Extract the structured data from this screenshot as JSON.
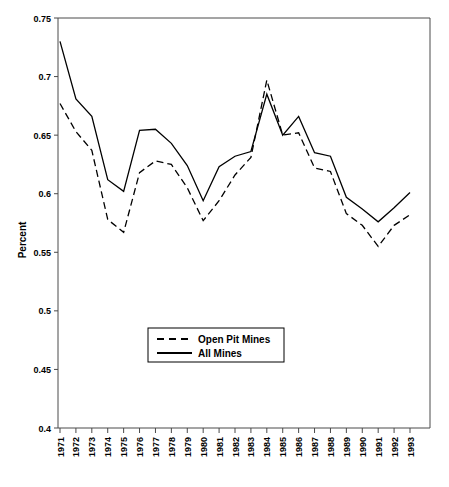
{
  "chart_data": {
    "type": "line",
    "title": "",
    "xlabel": "",
    "ylabel": "Percent",
    "xlim": [
      1971,
      1993
    ],
    "ylim": [
      0.4,
      0.75
    ],
    "yticks": [
      "0.4",
      "0.45",
      "0.5",
      "0.55",
      "0.6",
      "0.65",
      "0.7",
      "0.75"
    ],
    "ytick_values": [
      0.4,
      0.45,
      0.5,
      0.55,
      0.6,
      0.65,
      0.7,
      0.75
    ],
    "grid": false,
    "legend_position": "center-bottom-inside",
    "categories": [
      "1971",
      "1972",
      "1973",
      "1974",
      "1975",
      "1976",
      "1977",
      "1978",
      "1979",
      "1980",
      "1981",
      "1982",
      "1983",
      "1984",
      "1985",
      "1986",
      "1987",
      "1988",
      "1989",
      "1990",
      "1991",
      "1992",
      "1993"
    ],
    "x": [
      1971,
      1972,
      1973,
      1974,
      1975,
      1976,
      1977,
      1978,
      1979,
      1980,
      1981,
      1982,
      1983,
      1984,
      1985,
      1986,
      1987,
      1988,
      1989,
      1990,
      1991,
      1992,
      1993
    ],
    "series": [
      {
        "name": "Open Pit Mines",
        "style": "dashed",
        "color": "#000000",
        "values": [
          0.677,
          0.653,
          0.637,
          0.578,
          0.567,
          0.618,
          0.628,
          0.625,
          0.605,
          0.577,
          0.594,
          0.616,
          0.631,
          0.697,
          0.65,
          0.652,
          0.622,
          0.619,
          0.583,
          0.573,
          0.555,
          0.573,
          0.582
        ]
      },
      {
        "name": "All Mines",
        "style": "solid",
        "color": "#000000",
        "values": [
          0.73,
          0.681,
          0.666,
          0.612,
          0.602,
          0.654,
          0.655,
          0.643,
          0.624,
          0.594,
          0.623,
          0.632,
          0.636,
          0.685,
          0.65,
          0.666,
          0.635,
          0.632,
          0.597,
          0.587,
          0.576,
          0.588,
          0.601
        ]
      }
    ]
  },
  "legend": {
    "items": [
      {
        "label": "Open Pit Mines",
        "style": "dashed"
      },
      {
        "label": "All Mines",
        "style": "solid"
      }
    ]
  },
  "axes": {
    "y_title": "Percent"
  }
}
